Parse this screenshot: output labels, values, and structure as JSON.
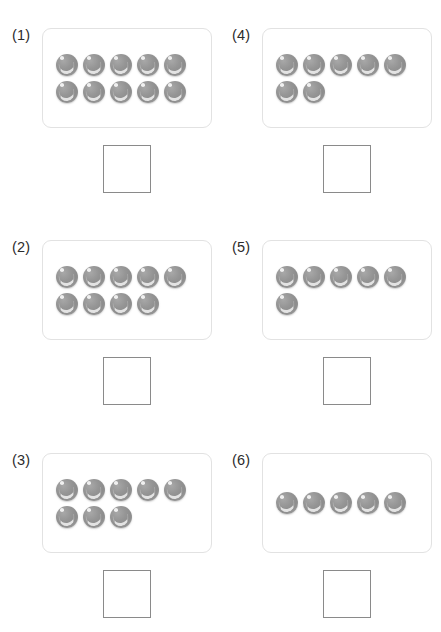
{
  "worksheet": {
    "title": "Ten-frame counting worksheet",
    "counter_color": "#909090",
    "frame_border_color": "#e2e2e2",
    "answer_box_border_color": "#8a8a8a",
    "frame_capacity": 10,
    "row_capacity": 5,
    "answer_box_value": "",
    "exercises": [
      {
        "label": "(1)",
        "position": "row-1 col-left",
        "counter_total": 10,
        "rows": [
          5,
          5
        ],
        "answer": ""
      },
      {
        "label": "(4)",
        "position": "row-1 col-right",
        "counter_total": 7,
        "rows": [
          5,
          2
        ],
        "answer": ""
      },
      {
        "label": "(2)",
        "position": "row-2 col-left",
        "counter_total": 9,
        "rows": [
          5,
          4
        ],
        "answer": ""
      },
      {
        "label": "(5)",
        "position": "row-2 col-right",
        "counter_total": 6,
        "rows": [
          5,
          1
        ],
        "answer": ""
      },
      {
        "label": "(3)",
        "position": "row-3 col-left",
        "counter_total": 8,
        "rows": [
          5,
          3
        ],
        "answer": ""
      },
      {
        "label": "(6)",
        "position": "row-3 col-right",
        "counter_total": 5,
        "rows": [
          5
        ],
        "answer": ""
      }
    ]
  }
}
